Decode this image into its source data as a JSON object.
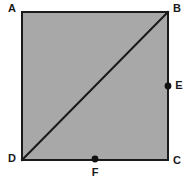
{
  "figure": {
    "kind": "geometry-diagram",
    "canvas": {
      "width": 192,
      "height": 187
    },
    "colors": {
      "background": "#ffffff",
      "shape_fill": "#a8a8a8",
      "stroke": "#1a1a1a",
      "label_text": "#1a1a1a",
      "point_marker": "#111111"
    },
    "square": {
      "name": "square-abcd",
      "x": 22,
      "y": 12,
      "width": 146,
      "height": 148,
      "stroke_width": 2.5
    },
    "diagonal": {
      "name": "diagonal-db",
      "from": "D",
      "to": "B",
      "x1": 22,
      "y1": 160,
      "x2": 168,
      "y2": 12,
      "stroke_width": 2
    },
    "vertices": [
      {
        "id": "A",
        "label": "A",
        "px": 22,
        "py": 12,
        "label_x": 12,
        "label_y": 9,
        "anchor": "middle"
      },
      {
        "id": "B",
        "label": "B",
        "px": 168,
        "py": 12,
        "label_x": 177,
        "label_y": 9,
        "anchor": "middle"
      },
      {
        "id": "C",
        "label": "C",
        "px": 168,
        "py": 160,
        "label_x": 177,
        "label_y": 161,
        "anchor": "middle"
      },
      {
        "id": "D",
        "label": "D",
        "px": 22,
        "py": 160,
        "label_x": 12,
        "label_y": 159,
        "anchor": "middle"
      }
    ],
    "marked_points": [
      {
        "id": "E",
        "label": "E",
        "px": 168,
        "py": 86,
        "radius": 3.4,
        "label_x": 179,
        "label_y": 86,
        "anchor": "middle",
        "on_side": "BC"
      },
      {
        "id": "F",
        "label": "F",
        "px": 95,
        "py": 159,
        "radius": 3.4,
        "label_x": 95,
        "label_y": 173,
        "anchor": "middle",
        "on_side": "DC"
      }
    ]
  }
}
